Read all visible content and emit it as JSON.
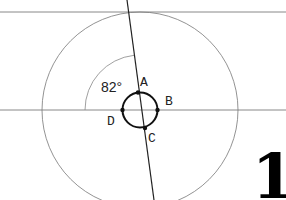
{
  "diagram": {
    "angle_label": "82°",
    "points": [
      {
        "name": "A",
        "x": 138,
        "y": 93
      },
      {
        "name": "B",
        "x": 157,
        "y": 110
      },
      {
        "name": "C",
        "x": 145,
        "y": 128
      },
      {
        "name": "D",
        "x": 122,
        "y": 110
      }
    ],
    "figure_number": "1",
    "colors": {
      "thin_line": "#888888",
      "thick_line": "#111111",
      "text": "#222222"
    }
  }
}
